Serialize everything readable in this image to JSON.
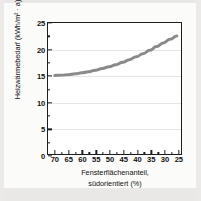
{
  "chart_data": {
    "type": "line",
    "title": "",
    "subtitle": "",
    "xlabel_line1": "Fensterflächenanteil,",
    "xlabel_line2": "südorientiert (%)",
    "ylabel": "Heizwärmebedarf (kWh/m² · a)",
    "xlim": [
      72.5,
      23.5
    ],
    "ylim": [
      0,
      25
    ],
    "x_reversed": true,
    "grid": "horizontal-faint",
    "legend": "none",
    "xticks": [
      70,
      65,
      60,
      55,
      50,
      45,
      40,
      35,
      30,
      25
    ],
    "xtick_labels": [
      "70",
      "65",
      "60",
      "55",
      "50",
      "45",
      "40",
      "35",
      "30",
      "25"
    ],
    "yticks": [
      0,
      5,
      10,
      15,
      20,
      25
    ],
    "ytick_labels": [
      "0",
      "5",
      "10",
      "15",
      "20",
      "25"
    ],
    "series": [
      {
        "name": "Heizwärmebedarf",
        "color": "#8a8a8a",
        "line_width": 3,
        "x": [
          70,
          67.5,
          65,
          62.5,
          60,
          57.5,
          55,
          52.5,
          50,
          47.5,
          45,
          42.5,
          40,
          37.5,
          35,
          32.5,
          30,
          27.5,
          25
        ],
        "values": [
          15.0,
          15.05,
          15.15,
          15.3,
          15.5,
          15.7,
          16.0,
          16.3,
          16.65,
          17.05,
          17.5,
          18.0,
          18.55,
          19.15,
          19.8,
          20.5,
          21.2,
          21.9,
          22.5
        ]
      }
    ]
  },
  "axes": {
    "y_title": "Heizwärmebedarf (kWh/m² · a)",
    "x_title_line1": "Fensterflächenanteil,",
    "x_title_line2": "südorientiert (%)"
  },
  "colors": {
    "curve": "#8a8a8a",
    "frame": "#1d1d1d",
    "grid": "#e6e6e6",
    "page": "#fbfbfa",
    "background": "#efeeec"
  }
}
